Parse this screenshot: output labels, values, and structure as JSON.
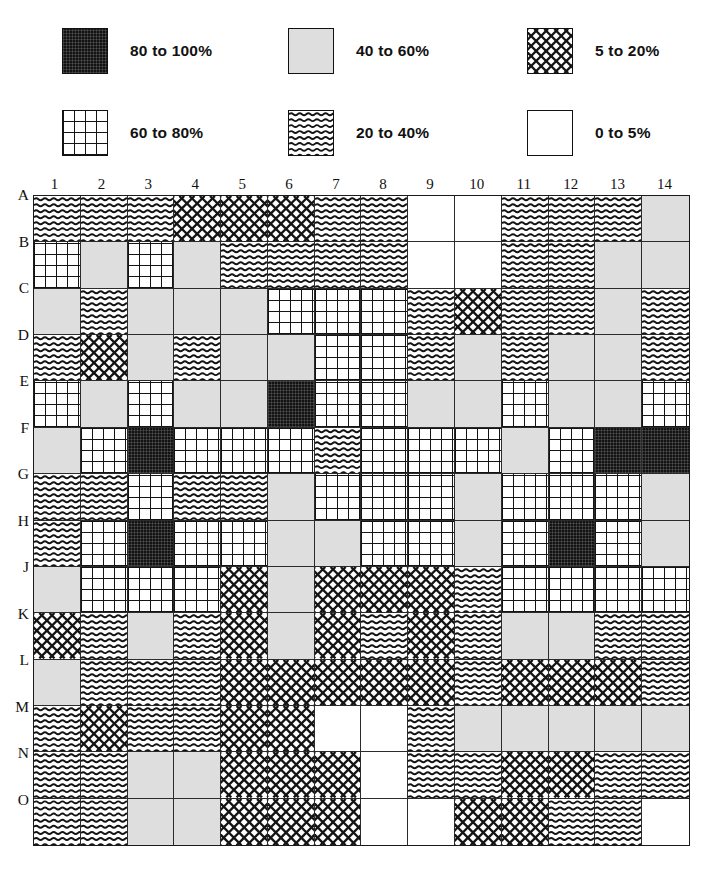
{
  "figure": {
    "type": "pattern-grid-map"
  },
  "legend": {
    "title": "",
    "items": [
      {
        "key": "p80",
        "label": "80 to 100%",
        "swatch": "solid-black-texture",
        "min": 80,
        "max": 100
      },
      {
        "key": "p40",
        "label": "40 to 60%",
        "swatch": "light-grey-solid",
        "min": 40,
        "max": 60
      },
      {
        "key": "p05",
        "label": "5 to 20%",
        "swatch": "diagonal-crosshatch",
        "min": 5,
        "max": 20
      },
      {
        "key": "p60",
        "label": "60 to 80%",
        "swatch": "square-grid",
        "min": 60,
        "max": 80
      },
      {
        "key": "p20",
        "label": "20 to 40%",
        "swatch": "wavy-horizontal",
        "min": 20,
        "max": 40
      },
      {
        "key": "p00",
        "label": "0 to 5%",
        "swatch": "blank-white",
        "min": 0,
        "max": 5
      }
    ]
  },
  "chart_data": {
    "type": "heatmap",
    "title": "",
    "xlabel": "",
    "ylabel": "",
    "grid": true,
    "legend_position": "top",
    "categories": [
      "1",
      "2",
      "3",
      "4",
      "5",
      "6",
      "7",
      "8",
      "9",
      "10",
      "11",
      "12",
      "13",
      "14"
    ],
    "row_labels": [
      "A",
      "B",
      "C",
      "D",
      "E",
      "F",
      "G",
      "H",
      "J",
      "K",
      "L",
      "M",
      "N",
      "O"
    ],
    "column_labels": [
      "1",
      "2",
      "3",
      "4",
      "5",
      "6",
      "7",
      "8",
      "9",
      "10",
      "11",
      "12",
      "13",
      "14"
    ],
    "value_keys": [
      "p00",
      "p05",
      "p20",
      "p40",
      "p60",
      "p80"
    ],
    "value_ranges": {
      "p00": "0 to 5%",
      "p05": "5 to 20%",
      "p20": "20 to 40%",
      "p40": "40 to 60%",
      "p60": "60 to 80%",
      "p80": "80 to 100%"
    },
    "cells": [
      [
        "p20",
        "p20",
        "p20",
        "p05",
        "p05",
        "p05",
        "p20",
        "p20",
        "p00",
        "p00",
        "p20",
        "p20",
        "p20",
        "p40"
      ],
      [
        "p60",
        "p40",
        "p60",
        "p40",
        "p20",
        "p20",
        "p20",
        "p20",
        "p00",
        "p00",
        "p20",
        "p20",
        "p40",
        "p40"
      ],
      [
        "p40",
        "p20",
        "p40",
        "p40",
        "p40",
        "p60",
        "p60",
        "p60",
        "p20",
        "p05",
        "p20",
        "p20",
        "p40",
        "p20"
      ],
      [
        "p20",
        "p05",
        "p40",
        "p20",
        "p40",
        "p40",
        "p60",
        "p60",
        "p20",
        "p40",
        "p20",
        "p40",
        "p40",
        "p20"
      ],
      [
        "p60",
        "p40",
        "p60",
        "p40",
        "p40",
        "p80",
        "p60",
        "p60",
        "p40",
        "p40",
        "p60",
        "p40",
        "p40",
        "p60"
      ],
      [
        "p40",
        "p60",
        "p80",
        "p60",
        "p60",
        "p60",
        "p20",
        "p60",
        "p60",
        "p60",
        "p40",
        "p60",
        "p80",
        "p80"
      ],
      [
        "p20",
        "p20",
        "p60",
        "p20",
        "p20",
        "p40",
        "p60",
        "p60",
        "p60",
        "p40",
        "p60",
        "p60",
        "p60",
        "p40"
      ],
      [
        "p20",
        "p60",
        "p80",
        "p60",
        "p60",
        "p40",
        "p40",
        "p60",
        "p60",
        "p40",
        "p60",
        "p80",
        "p60",
        "p40"
      ],
      [
        "p40",
        "p60",
        "p60",
        "p60",
        "p05",
        "p40",
        "p05",
        "p05",
        "p05",
        "p20",
        "p60",
        "p60",
        "p60",
        "p60"
      ],
      [
        "p05",
        "p20",
        "p40",
        "p20",
        "p05",
        "p40",
        "p05",
        "p20",
        "p05",
        "p20",
        "p40",
        "p40",
        "p20",
        "p20"
      ],
      [
        "p40",
        "p20",
        "p20",
        "p20",
        "p05",
        "p05",
        "p05",
        "p05",
        "p05",
        "p20",
        "p05",
        "p05",
        "p05",
        "p20"
      ],
      [
        "p20",
        "p05",
        "p20",
        "p20",
        "p05",
        "p05",
        "p00",
        "p00",
        "p20",
        "p40",
        "p40",
        "p40",
        "p40",
        "p40"
      ],
      [
        "p20",
        "p20",
        "p40",
        "p40",
        "p05",
        "p05",
        "p05",
        "p00",
        "p20",
        "p20",
        "p05",
        "p05",
        "p20",
        "p20"
      ],
      [
        "p20",
        "p20",
        "p40",
        "p40",
        "p05",
        "p05",
        "p05",
        "p00",
        "p00",
        "p05",
        "p05",
        "p20",
        "p20",
        "p00"
      ]
    ]
  }
}
